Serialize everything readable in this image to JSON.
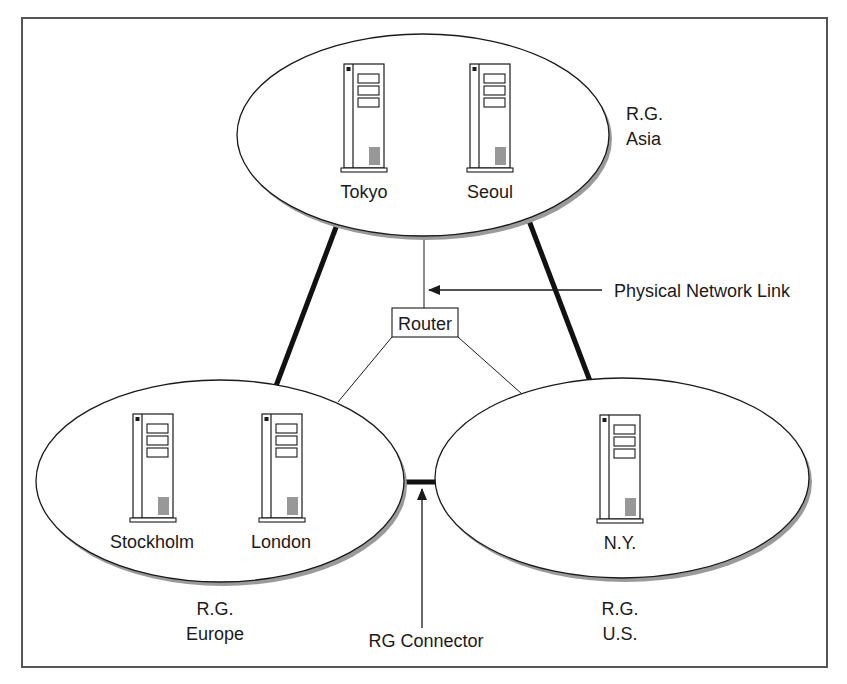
{
  "diagram": {
    "frame": {
      "x": 22,
      "y": 18,
      "width": 805,
      "height": 649,
      "stroke": "#555555"
    },
    "colors": {
      "line": "#1a1a1a",
      "shadow": "#9a9a9a",
      "fill": "#ffffff"
    },
    "router": {
      "label": "Router"
    },
    "callouts": {
      "physical_link": "Physical Network Link",
      "rg_connector": "RG Connector"
    },
    "routing_groups": [
      {
        "id": "asia",
        "label_line1": "R.G.",
        "label_line2": "Asia",
        "servers": [
          {
            "name": "Tokyo",
            "icon": "server-tower-icon"
          },
          {
            "name": "Seoul",
            "icon": "server-tower-icon"
          }
        ]
      },
      {
        "id": "europe",
        "label_line1": "R.G.",
        "label_line2": "Europe",
        "servers": [
          {
            "name": "Stockholm",
            "icon": "server-tower-icon"
          },
          {
            "name": "London",
            "icon": "server-tower-icon"
          }
        ]
      },
      {
        "id": "us",
        "label_line1": "R.G.",
        "label_line2": "U.S.",
        "servers": [
          {
            "name": "N.Y.",
            "icon": "server-tower-icon"
          }
        ]
      }
    ],
    "links": [
      {
        "from": "asia",
        "to": "europe",
        "type": "thick"
      },
      {
        "from": "asia",
        "to": "us",
        "type": "thick"
      },
      {
        "from": "europe",
        "to": "us",
        "type": "rg-connector"
      },
      {
        "from": "asia",
        "to": "router",
        "type": "physical"
      },
      {
        "from": "router",
        "to": "europe",
        "type": "physical"
      },
      {
        "from": "router",
        "to": "us",
        "type": "physical"
      }
    ]
  }
}
